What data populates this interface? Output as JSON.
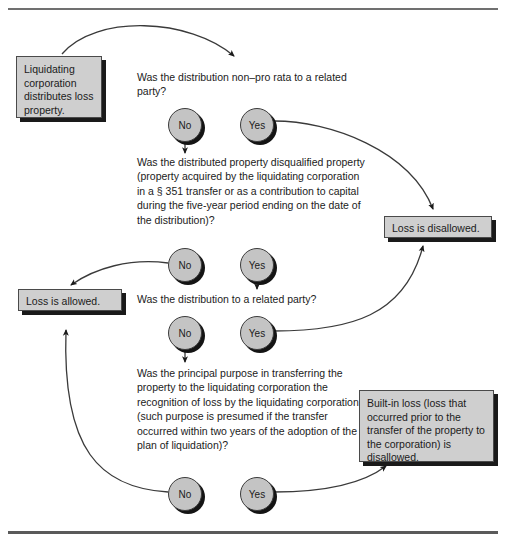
{
  "figure": {
    "colors": {
      "box_fill": "#cfcfcf",
      "circle_fill": "#c4c4c4",
      "shadow": "#141414",
      "stroke": "#3c3c3c",
      "text": "#1b1b1b",
      "rule": "#6f6f6f"
    }
  },
  "nodes": {
    "start": "Liquidating corporation distributes loss property.",
    "disallowed": "Loss is disallowed.",
    "allowed": "Loss is allowed.",
    "builtin": "Built-in loss (loss that occurred prior to the transfer of the property to the corporation) is disallowed."
  },
  "questions": {
    "q1": "Was the distribution non–pro rata to a related party?",
    "q2": "Was the distributed property disqualified property (property acquired by the liquidating corporation in a § 351 transfer or as a contribution to capital during the five-year period ending on the date of the distribution)?",
    "q3": "Was the distribution to a related party?",
    "q4": "Was the principal purpose in transferring the property to the liquidating corporation the recognition of loss by the liquidating corporation (such purpose is presumed if the transfer occurred within two years of the adoption of the plan of liquidation)?"
  },
  "decisions": [
    {
      "id": "q1",
      "no": "No",
      "yes": "Yes"
    },
    {
      "id": "q2",
      "no": "No",
      "yes": "Yes"
    },
    {
      "id": "q3",
      "no": "No",
      "yes": "Yes"
    },
    {
      "id": "q4",
      "no": "No",
      "yes": "Yes"
    }
  ],
  "edges": [
    {
      "from": "start",
      "to": "q1",
      "label": ""
    },
    {
      "from": "q1.no",
      "to": "q2",
      "label": "No"
    },
    {
      "from": "q1.yes",
      "to": "disallowed",
      "label": "Yes"
    },
    {
      "from": "q2.no",
      "to": "allowed",
      "label": "No"
    },
    {
      "from": "q2.yes",
      "to": "q3",
      "label": "Yes"
    },
    {
      "from": "q3.no",
      "to": "q4",
      "label": "No"
    },
    {
      "from": "q3.yes",
      "to": "disallowed",
      "label": "Yes"
    },
    {
      "from": "q4.no",
      "to": "allowed",
      "label": "No"
    },
    {
      "from": "q4.yes",
      "to": "builtin",
      "label": "Yes"
    }
  ]
}
